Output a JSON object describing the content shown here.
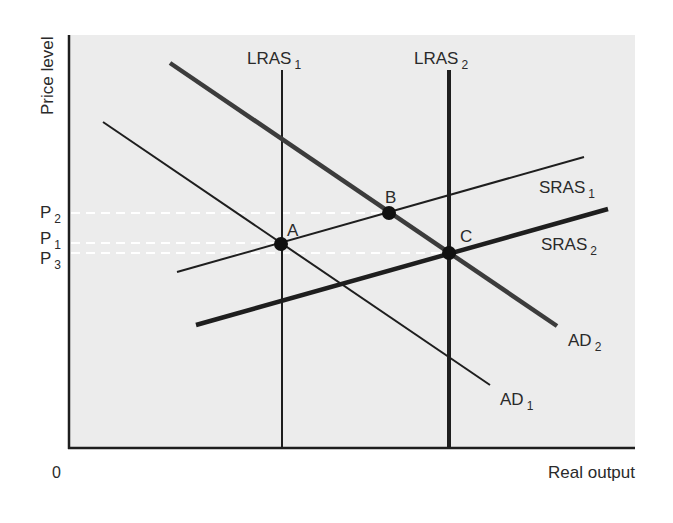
{
  "chart_data": {
    "type": "line",
    "title": "",
    "xlabel": "Real output",
    "ylabel": "Price level",
    "origin_label": "0",
    "grid": false,
    "colors": {
      "plot_bg": "#ececec",
      "page_bg": "#ffffff",
      "line": "#1e1e1e",
      "ad2": "#3c3c3c",
      "dash": "#ffffff"
    },
    "price_levels": [
      {
        "label": "P",
        "sub": "2",
        "y": 213,
        "to_x": 389
      },
      {
        "label": "P",
        "sub": "1",
        "y": 243,
        "to_x": 281
      },
      {
        "label": "P",
        "sub": "3",
        "y": 253,
        "to_x": 449
      }
    ],
    "series": [
      {
        "name": "LRAS1",
        "label": "LRAS",
        "sub": "1",
        "x1": 282,
        "y1": 70,
        "x2": 282,
        "y2": 448,
        "width": 2,
        "lx": 247,
        "ly": 64
      },
      {
        "name": "LRAS2",
        "label": "LRAS",
        "sub": "2",
        "x1": 449,
        "y1": 70,
        "x2": 449,
        "y2": 448,
        "width": 4,
        "lx": 414,
        "ly": 64
      },
      {
        "name": "AD1",
        "label": "AD",
        "sub": "1",
        "x1": 103,
        "y1": 122,
        "x2": 490,
        "y2": 385,
        "width": 2,
        "lx": 500,
        "ly": 405
      },
      {
        "name": "AD2",
        "label": "AD",
        "sub": "2",
        "x1": 170,
        "y1": 63,
        "x2": 557,
        "y2": 326,
        "width": 4.5,
        "lx": 568,
        "ly": 346
      },
      {
        "name": "SRAS1",
        "label": "SRAS",
        "sub": "1",
        "x1": 177,
        "y1": 272,
        "x2": 584,
        "y2": 157,
        "width": 2,
        "lx": 539,
        "ly": 193
      },
      {
        "name": "SRAS2",
        "label": "SRAS",
        "sub": "2",
        "x1": 196,
        "y1": 325,
        "x2": 608,
        "y2": 209,
        "width": 4.5,
        "lx": 541,
        "ly": 250
      }
    ],
    "points": [
      {
        "label": "A",
        "x": 281,
        "y": 244,
        "lx": 287,
        "ly": 236
      },
      {
        "label": "B",
        "x": 389,
        "y": 213,
        "lx": 385,
        "ly": 203
      },
      {
        "label": "C",
        "x": 449,
        "y": 253,
        "lx": 460,
        "ly": 242
      }
    ],
    "axes": {
      "x0": 69,
      "y0": 448,
      "x_end": 635,
      "y_top": 35
    }
  }
}
